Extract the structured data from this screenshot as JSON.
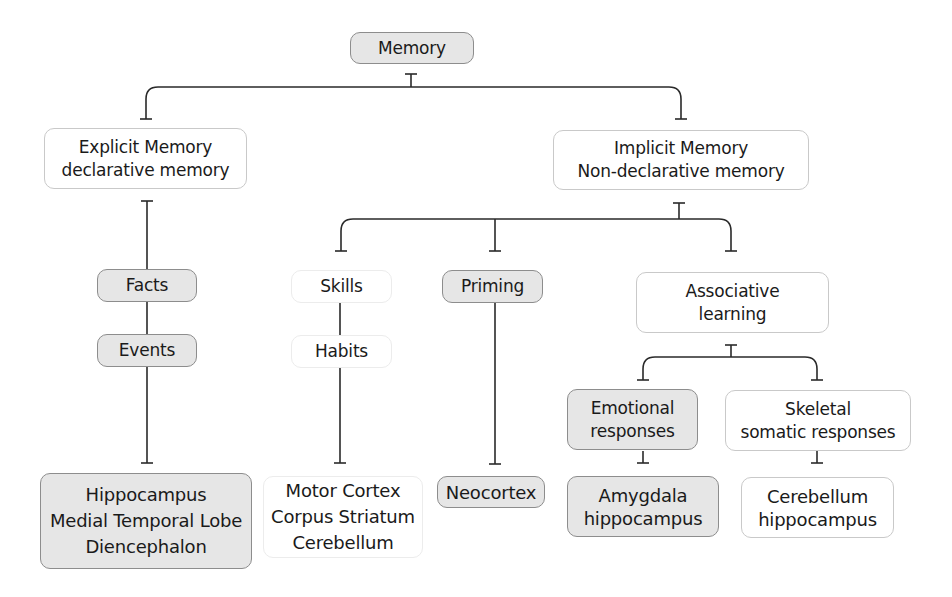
{
  "diagram": {
    "type": "hierarchy-tree",
    "colors": {
      "shaded_fill": "#e6e6e6",
      "shaded_border": "#8d8d8d",
      "plain_border": "#c9c9c9",
      "line": "#2a2a2a"
    },
    "nodes": {
      "memory": {
        "lines": [
          "Memory"
        ],
        "style": "shaded"
      },
      "explicit": {
        "lines": [
          "Explicit Memory",
          "declarative memory"
        ],
        "style": "plain"
      },
      "implicit": {
        "lines": [
          "Implicit Memory",
          "Non-declarative memory"
        ],
        "style": "plain"
      },
      "facts": {
        "lines": [
          "Facts"
        ],
        "style": "shaded"
      },
      "events": {
        "lines": [
          "Events"
        ],
        "style": "shaded"
      },
      "explicit_regions": {
        "lines": [
          "Hippocampus",
          "Medial Temporal Lobe",
          "Diencephalon"
        ],
        "style": "shaded"
      },
      "skills": {
        "lines": [
          "Skills"
        ],
        "style": "ghost"
      },
      "habits": {
        "lines": [
          "Habits"
        ],
        "style": "ghost"
      },
      "skills_regions": {
        "lines": [
          "Motor Cortex",
          "Corpus Striatum",
          "Cerebellum"
        ],
        "style": "ghost"
      },
      "priming": {
        "lines": [
          "Priming"
        ],
        "style": "shaded"
      },
      "neocortex": {
        "lines": [
          "Neocortex"
        ],
        "style": "shaded"
      },
      "associative": {
        "lines": [
          "Associative",
          "learning"
        ],
        "style": "plain"
      },
      "emotional": {
        "lines": [
          "Emotional",
          "responses"
        ],
        "style": "shaded"
      },
      "skeletal": {
        "lines": [
          "Skeletal",
          "somatic responses"
        ],
        "style": "plain"
      },
      "emotional_regions": {
        "lines": [
          "Amygdala",
          "hippocampus"
        ],
        "style": "shaded"
      },
      "skeletal_regions": {
        "lines": [
          "Cerebellum",
          "hippocampus"
        ],
        "style": "plain"
      }
    },
    "edges": [
      [
        "memory",
        "explicit"
      ],
      [
        "memory",
        "implicit"
      ],
      [
        "explicit",
        "facts"
      ],
      [
        "facts",
        "events"
      ],
      [
        "events",
        "explicit_regions"
      ],
      [
        "implicit",
        "skills"
      ],
      [
        "implicit",
        "priming"
      ],
      [
        "implicit",
        "associative"
      ],
      [
        "skills",
        "habits"
      ],
      [
        "habits",
        "skills_regions"
      ],
      [
        "priming",
        "neocortex"
      ],
      [
        "associative",
        "emotional"
      ],
      [
        "associative",
        "skeletal"
      ],
      [
        "emotional",
        "emotional_regions"
      ],
      [
        "skeletal",
        "skeletal_regions"
      ]
    ]
  }
}
